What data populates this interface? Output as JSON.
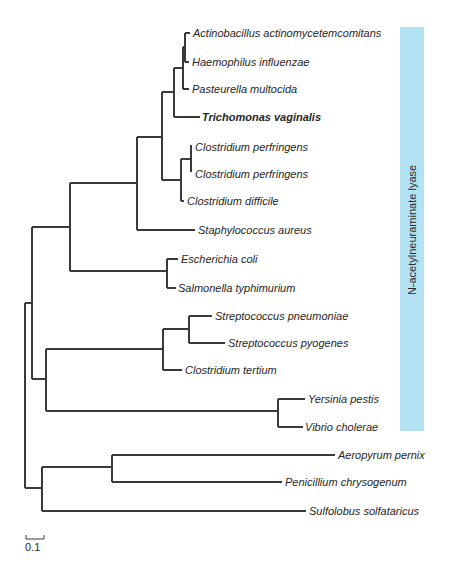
{
  "figure": {
    "type": "phylogenetic-tree",
    "band_label": "N-acetylneuraminate lyase",
    "band_color": "#b3e3f3",
    "scale_bar_label": "0.1",
    "scale_bar_value": 0.1
  },
  "taxa": [
    {
      "id": "t1",
      "name": "Actinobacillus actinomycetemcomitans",
      "bold": false
    },
    {
      "id": "t2",
      "name": "Haemophilus influenzae",
      "bold": false
    },
    {
      "id": "t3",
      "name": "Pasteurella multocida",
      "bold": false
    },
    {
      "id": "t4",
      "name": "Trichomonas vaginalis",
      "bold": true
    },
    {
      "id": "t5",
      "name": "Clostridium perfringens",
      "bold": false
    },
    {
      "id": "t6",
      "name": "Clostridium perfringens",
      "bold": false
    },
    {
      "id": "t7",
      "name": "Clostridium difficile",
      "bold": false
    },
    {
      "id": "t8",
      "name": "Staphylococcus aureus",
      "bold": false
    },
    {
      "id": "t9",
      "name": "Escherichia coli",
      "bold": false
    },
    {
      "id": "t10",
      "name": "Salmonella typhimurium",
      "bold": false
    },
    {
      "id": "t11",
      "name": "Streptococcus pneumoniae",
      "bold": false
    },
    {
      "id": "t12",
      "name": "Streptococcus pyogenes",
      "bold": false
    },
    {
      "id": "t13",
      "name": "Clostridium tertium",
      "bold": false
    },
    {
      "id": "t14",
      "name": "Yersinia pestis",
      "bold": false
    },
    {
      "id": "t15",
      "name": "Vibrio cholerae",
      "bold": false
    },
    {
      "id": "t16",
      "name": "Aeropyrum pernix",
      "bold": false
    },
    {
      "id": "t17",
      "name": "Penicillium chrysogenum",
      "bold": false
    },
    {
      "id": "t18",
      "name": "Sulfolobus solfataricus",
      "bold": false
    }
  ],
  "newick": "((((((((t1,t2),t3),t4),((t5,t6),t7)),t8),(t9,t10)),(((t11,t12),t13),(t14,t15))),((t16,t17),t18))"
}
